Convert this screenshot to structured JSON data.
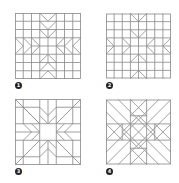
{
  "figure": {
    "type": "quilt-block-diagrams",
    "line_color": "#8a8a8a",
    "background": "#ffffff",
    "badge_color": "#222222",
    "panels": [
      {
        "id": 1,
        "label": "1",
        "description": "8x8 grid quilt block with V-shaped star points"
      },
      {
        "id": 2,
        "label": "2",
        "description": "8x8 grid quilt block with arrow star points"
      },
      {
        "id": 3,
        "label": "3",
        "description": "eight-pointed star block with central square and diagonal rays"
      },
      {
        "id": 4,
        "label": "4",
        "description": "diagonal cross and diamond block"
      }
    ]
  }
}
